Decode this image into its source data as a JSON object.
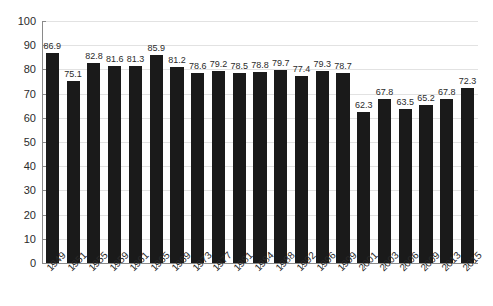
{
  "chart_data": {
    "type": "bar",
    "title": "",
    "subtitle": "",
    "xlabel": "",
    "ylabel": "",
    "ylim": [
      0,
      100
    ],
    "y_ticks": [
      0,
      10,
      20,
      30,
      40,
      50,
      60,
      70,
      80,
      90,
      100
    ],
    "y_tick_labels": [
      "0",
      "10",
      "20",
      "30",
      "40",
      "50",
      "60",
      "70",
      "80",
      "90",
      "100"
    ],
    "grid": true,
    "grid_axis": "y",
    "legend": false,
    "legend_position": "none",
    "bar_color": "#1a1a1a",
    "gridline_color": "#e2e2e2",
    "axis_color": "#8a8a8a",
    "data_labels": true,
    "x_label_rotation": -45,
    "categories": [
      "1949",
      "1951",
      "1955",
      "1959",
      "1961",
      "1965",
      "1969",
      "1973",
      "1977",
      "1981",
      "1984",
      "1988",
      "1992",
      "1996",
      "1999",
      "2001",
      "2003",
      "2006",
      "2009",
      "2013",
      "2015"
    ],
    "values": [
      86.9,
      75.1,
      82.8,
      81.6,
      81.3,
      85.9,
      81.2,
      78.6,
      79.2,
      78.5,
      78.8,
      79.7,
      77.4,
      79.3,
      78.7,
      62.3,
      67.8,
      63.5,
      65.2,
      67.8,
      72.3
    ],
    "value_labels": [
      "86.9",
      "75.1",
      "82.8",
      "81.6",
      "81.3",
      "85.9",
      "81.2",
      "78.6",
      "79.2",
      "78.5",
      "78.8",
      "79.7",
      "77.4",
      "79.3",
      "78.7",
      "62.3",
      "67.8",
      "63.5",
      "65.2",
      "67.8",
      "72.3"
    ]
  }
}
